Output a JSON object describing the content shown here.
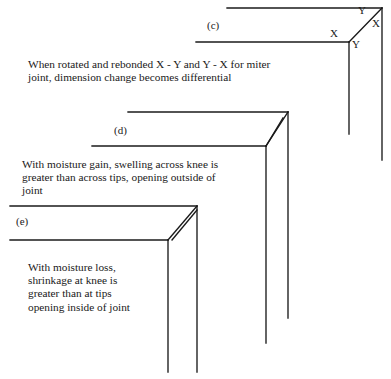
{
  "figure": {
    "panels": [
      {
        "id": "c",
        "label": "(c)",
        "label_pos": {
          "x": 207,
          "y": 19
        },
        "caption_lines": [
          "When rotated and rebonded X - Y and Y - X for miter",
          "joint, dimension change becomes differential"
        ],
        "caption_pos": {
          "x": 28,
          "y": 58
        },
        "dimension_labels": [
          {
            "text": "Y",
            "x": 358,
            "y": 4
          },
          {
            "text": "X",
            "x": 372,
            "y": 17
          },
          {
            "text": "X",
            "x": 330,
            "y": 27
          },
          {
            "text": "Y",
            "x": 352,
            "y": 38
          }
        ]
      },
      {
        "id": "d",
        "label": "(d)",
        "label_pos": {
          "x": 114,
          "y": 124
        },
        "caption_lines": [
          "With moisture gain, swelling across knee is",
          "greater than across tips, opening outside of",
          "joint"
        ],
        "caption_pos": {
          "x": 22,
          "y": 158
        },
        "dimension_labels": []
      },
      {
        "id": "e",
        "label": "(e)",
        "label_pos": {
          "x": 16,
          "y": 215
        },
        "caption_lines": [
          "With moisture loss,",
          "shrinkage at knee is",
          "greater than at tips",
          "opening inside of joint"
        ],
        "caption_pos": {
          "x": 28,
          "y": 261
        },
        "dimension_labels": []
      }
    ],
    "colors": {
      "stroke": "#1a1a1a",
      "background": "#ffffff",
      "text": "#1a1a1a"
    }
  }
}
